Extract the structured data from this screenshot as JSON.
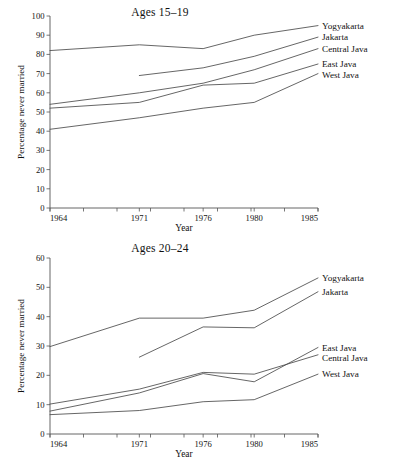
{
  "figure": {
    "background": "#ffffff",
    "line_color": "#4a4a4a",
    "text_color": "#111111"
  },
  "panels": [
    {
      "id": "ages-15-19",
      "title": "Ages 15–19",
      "xlabel": "Year",
      "ylabel": "Percentage never married"
    },
    {
      "id": "ages-20-24",
      "title": "Ages 20–24",
      "xlabel": "Year",
      "ylabel": "Percentage never married"
    }
  ],
  "chart_data": [
    {
      "type": "line",
      "title": "Ages 15–19",
      "xlabel": "Year",
      "ylabel": "Percentage never married",
      "x": [
        1964,
        1971,
        1976,
        1980,
        1985
      ],
      "xticklabels": [
        "1964",
        "1971",
        "1976",
        "1980",
        "1985"
      ],
      "xlim": [
        1964,
        1985
      ],
      "ylim": [
        0,
        100
      ],
      "yticks": [
        0,
        10,
        20,
        30,
        40,
        50,
        60,
        70,
        80,
        90,
        100
      ],
      "yticklabels": [
        "0",
        "10",
        "20",
        "30",
        "40",
        "50",
        "60",
        "70",
        "80",
        "90",
        "100"
      ],
      "grid": false,
      "legend_position": "right-of-line-ends",
      "series": [
        {
          "name": "Yogyakarta",
          "x": [
            1964,
            1971,
            1976,
            1980,
            1985
          ],
          "values": [
            82,
            85,
            83,
            90,
            95
          ]
        },
        {
          "name": "Jakarta",
          "x": [
            1971,
            1976,
            1980,
            1985
          ],
          "values": [
            69,
            73,
            79,
            89
          ]
        },
        {
          "name": "Central Java",
          "x": [
            1964,
            1971,
            1976,
            1980,
            1985
          ],
          "values": [
            54,
            60,
            65,
            72,
            83
          ]
        },
        {
          "name": "East Java",
          "x": [
            1964,
            1971,
            1976,
            1980,
            1985
          ],
          "values": [
            52,
            55,
            64,
            65,
            75
          ]
        },
        {
          "name": "West Java",
          "x": [
            1964,
            1971,
            1976,
            1980,
            1985
          ],
          "values": [
            41,
            47,
            52,
            55,
            70
          ]
        }
      ]
    },
    {
      "type": "line",
      "title": "Ages 20–24",
      "xlabel": "Year",
      "ylabel": "Percentage never married",
      "x": [
        1964,
        1971,
        1976,
        1980,
        1985
      ],
      "xticklabels": [
        "1964",
        "1971",
        "1976",
        "1980",
        "1985"
      ],
      "xlim": [
        1964,
        1985
      ],
      "ylim": [
        0,
        60
      ],
      "yticks": [
        0,
        10,
        20,
        30,
        40,
        50,
        60
      ],
      "yticklabels": [
        "0",
        "10",
        "20",
        "30",
        "40",
        "50",
        "60"
      ],
      "grid": false,
      "legend_position": "right-of-line-ends",
      "series": [
        {
          "name": "Yogyakarta",
          "x": [
            1964,
            1971,
            1976,
            1980,
            1985
          ],
          "values": [
            29.8,
            39.5,
            39.5,
            42.2,
            53.2
          ]
        },
        {
          "name": "Jakarta",
          "x": [
            1971,
            1976,
            1980,
            1985
          ],
          "values": [
            26.2,
            36.5,
            36.2,
            48.5
          ]
        },
        {
          "name": "East Java",
          "x": [
            1964,
            1971,
            1976,
            1980,
            1985
          ],
          "values": [
            7.8,
            14.0,
            20.6,
            17.8,
            29.5
          ]
        },
        {
          "name": "Central Java",
          "x": [
            1964,
            1971,
            1976,
            1980,
            1985
          ],
          "values": [
            10.2,
            15.3,
            21.0,
            20.4,
            27.0
          ]
        },
        {
          "name": "West Java",
          "x": [
            1964,
            1971,
            1976,
            1980,
            1985
          ],
          "values": [
            6.6,
            8.0,
            11.0,
            11.7,
            20.4
          ]
        }
      ]
    }
  ]
}
